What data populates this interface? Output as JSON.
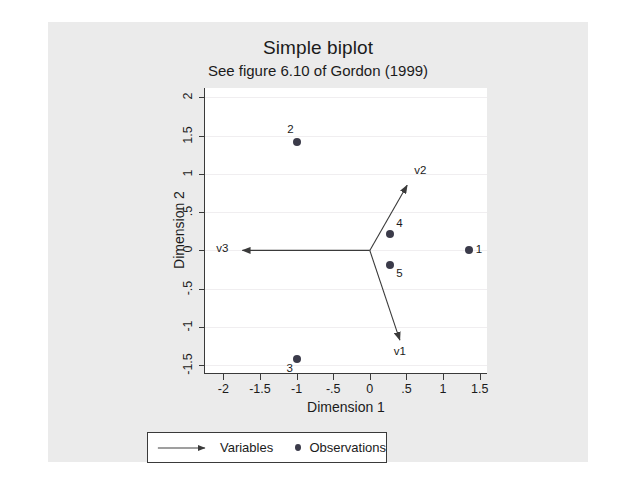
{
  "header": {
    "title": "Simple biplot",
    "subtitle": "See figure 6.10 of Gordon (1999)"
  },
  "chart_data": {
    "type": "scatter",
    "title": "Simple biplot",
    "subtitle": "See figure 6.10 of Gordon (1999)",
    "xlabel": "Dimension 1",
    "ylabel": "Dimension 2",
    "xlim": [
      -2.25,
      1.6
    ],
    "ylim": [
      -1.6,
      2.12
    ],
    "xticks": [
      "-2",
      "-1.5",
      "-1",
      "-.5",
      "0",
      ".5",
      "1",
      "1.5"
    ],
    "xtick_values": [
      -2,
      -1.5,
      -1,
      -0.5,
      0,
      0.5,
      1,
      1.5
    ],
    "yticks": [
      "2",
      "1.5",
      "1",
      ".5",
      "0",
      "-.5",
      "-1",
      "-1.5"
    ],
    "ytick_values": [
      2,
      1.5,
      1,
      0.5,
      0,
      -0.5,
      -1,
      -1.5
    ],
    "grid": true,
    "grid_axis": "y",
    "legend_position": "bottom",
    "observations": [
      {
        "label": "1",
        "x": 1.35,
        "y": 0.0,
        "label_pos": "right"
      },
      {
        "label": "2",
        "x": -0.99,
        "y": 1.41,
        "label_pos": "top-left"
      },
      {
        "label": "3",
        "x": -1.0,
        "y": -1.42,
        "label_pos": "bottom-left"
      },
      {
        "label": "4",
        "x": 0.28,
        "y": 0.21,
        "label_pos": "top-right"
      },
      {
        "label": "5",
        "x": 0.28,
        "y": -0.19,
        "label_pos": "bottom-right"
      }
    ],
    "variables": [
      {
        "label": "v1",
        "x": 0.41,
        "y": -1.17,
        "label_pos": "bottom"
      },
      {
        "label": "v2",
        "x": 0.51,
        "y": 0.85,
        "label_pos": "top-right"
      },
      {
        "label": "v3",
        "x": -1.74,
        "y": 0.0,
        "label_pos": "left"
      }
    ],
    "vector_origin": {
      "x": 0,
      "y": 0
    },
    "series": [
      {
        "name": "Variables",
        "marker": "arrow"
      },
      {
        "name": "Observations",
        "marker": "dot"
      }
    ]
  },
  "legend": {
    "variables_label": "Variables",
    "observations_label": "Observations"
  },
  "colors": {
    "marker": "#3b3b4a",
    "axis": "#3a3a3a",
    "grid": "#f0eef0",
    "text": "#1b1b1b",
    "page": "#ebebeb",
    "plot_bg": "#ffffff"
  }
}
